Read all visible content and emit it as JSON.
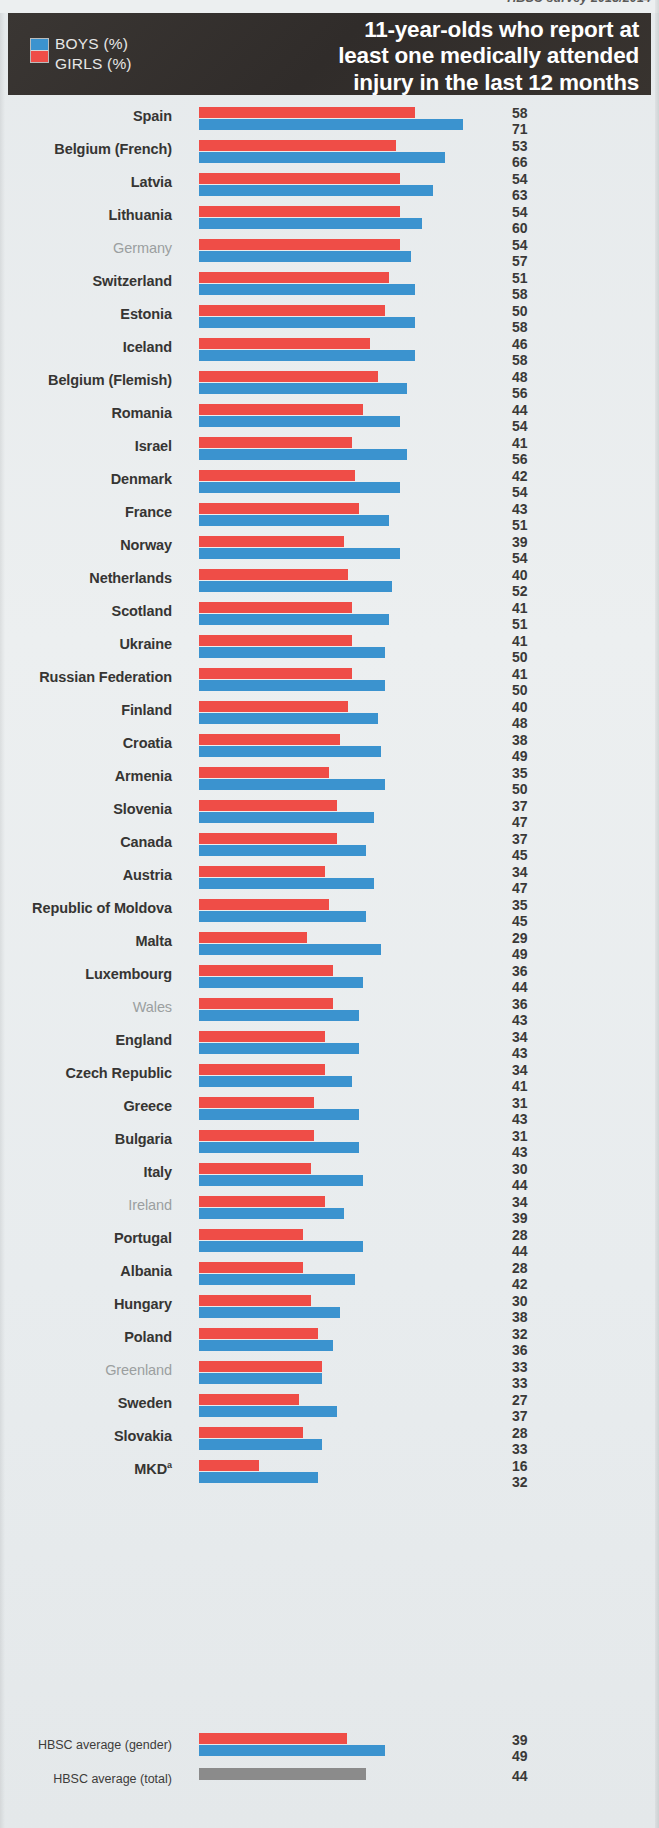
{
  "source_note": "HBSC survey 2013/2014",
  "header": {
    "title_line1": "11-year-olds who report at",
    "title_line2": "least one medically attended",
    "title_line3": "injury in the last 12 months",
    "legend": {
      "boys_label": "BOYS (%)",
      "girls_label": "GIRLS (%)"
    }
  },
  "colors": {
    "boys": "#3b93cf",
    "girls": "#ef4d47",
    "total": "#8b8b8b",
    "banner": "#332f2d",
    "background": "#e9edee",
    "label_bold": "#363533",
    "label_dim": "#9b9fa0"
  },
  "averages": {
    "gender_label": "HBSC average (gender)",
    "total_label": "HBSC average (total)",
    "gender_girls": 39,
    "gender_boys": 49,
    "total_value": 44
  },
  "chart_data": {
    "type": "bar",
    "orientation": "horizontal",
    "title": "11-year-olds who report at least one medically attended injury in the last 12 months",
    "xlabel": "",
    "ylabel": "",
    "xlim": [
      0,
      71
    ],
    "grid": false,
    "legend_position": "top-left",
    "series": [
      {
        "name": "GIRLS (%)",
        "color": "#ef4d47",
        "values": [
          58,
          53,
          54,
          54,
          54,
          51,
          50,
          46,
          48,
          44,
          41,
          42,
          43,
          39,
          40,
          41,
          41,
          41,
          40,
          38,
          35,
          37,
          37,
          34,
          35,
          29,
          36,
          36,
          34,
          34,
          31,
          31,
          30,
          34,
          28,
          28,
          30,
          32,
          33,
          27,
          28,
          16
        ]
      },
      {
        "name": "BOYS (%)",
        "color": "#3b93cf",
        "values": [
          71,
          66,
          63,
          60,
          57,
          58,
          58,
          58,
          56,
          54,
          56,
          54,
          51,
          54,
          52,
          51,
          50,
          50,
          48,
          49,
          50,
          47,
          45,
          47,
          45,
          49,
          44,
          43,
          43,
          41,
          43,
          43,
          44,
          39,
          44,
          42,
          38,
          36,
          33,
          37,
          33,
          32
        ]
      }
    ],
    "categories": [
      "Spain",
      "Belgium (French)",
      "Latvia",
      "Lithuania",
      "Germany",
      "Switzerland",
      "Estonia",
      "Iceland",
      "Belgium (Flemish)",
      "Romania",
      "Israel",
      "Denmark",
      "France",
      "Norway",
      "Netherlands",
      "Scotland",
      "Ukraine",
      "Russian Federation",
      "Finland",
      "Croatia",
      "Armenia",
      "Slovenia",
      "Canada",
      "Austria",
      "Republic of Moldova",
      "Malta",
      "Luxembourg",
      "Wales",
      "England",
      "Czech Republic",
      "Greece",
      "Bulgaria",
      "Italy",
      "Ireland",
      "Portugal",
      "Albania",
      "Hungary",
      "Poland",
      "Greenland",
      "Sweden",
      "Slovakia",
      "MKD"
    ],
    "dimmed_categories": [
      "Germany",
      "Wales",
      "Ireland",
      "Greenland"
    ],
    "footnote_markers": {
      "MKD": "a"
    },
    "averages": {
      "girls": 39,
      "boys": 49,
      "total": 44
    }
  },
  "rows": [
    {
      "label": "Spain",
      "girls": 58,
      "boys": 71,
      "dim": false
    },
    {
      "label": "Belgium (French)",
      "girls": 53,
      "boys": 66,
      "dim": false
    },
    {
      "label": "Latvia",
      "girls": 54,
      "boys": 63,
      "dim": false
    },
    {
      "label": "Lithuania",
      "girls": 54,
      "boys": 60,
      "dim": false
    },
    {
      "label": "Germany",
      "girls": 54,
      "boys": 57,
      "dim": true
    },
    {
      "label": "Switzerland",
      "girls": 51,
      "boys": 58,
      "dim": false
    },
    {
      "label": "Estonia",
      "girls": 50,
      "boys": 58,
      "dim": false
    },
    {
      "label": "Iceland",
      "girls": 46,
      "boys": 58,
      "dim": false
    },
    {
      "label": "Belgium (Flemish)",
      "girls": 48,
      "boys": 56,
      "dim": false
    },
    {
      "label": "Romania",
      "girls": 44,
      "boys": 54,
      "dim": false
    },
    {
      "label": "Israel",
      "girls": 41,
      "boys": 56,
      "dim": false
    },
    {
      "label": "Denmark",
      "girls": 42,
      "boys": 54,
      "dim": false
    },
    {
      "label": "France",
      "girls": 43,
      "boys": 51,
      "dim": false
    },
    {
      "label": "Norway",
      "girls": 39,
      "boys": 54,
      "dim": false
    },
    {
      "label": "Netherlands",
      "girls": 40,
      "boys": 52,
      "dim": false
    },
    {
      "label": "Scotland",
      "girls": 41,
      "boys": 51,
      "dim": false
    },
    {
      "label": "Ukraine",
      "girls": 41,
      "boys": 50,
      "dim": false
    },
    {
      "label": "Russian Federation",
      "girls": 41,
      "boys": 50,
      "dim": false
    },
    {
      "label": "Finland",
      "girls": 40,
      "boys": 48,
      "dim": false
    },
    {
      "label": "Croatia",
      "girls": 38,
      "boys": 49,
      "dim": false
    },
    {
      "label": "Armenia",
      "girls": 35,
      "boys": 50,
      "dim": false
    },
    {
      "label": "Slovenia",
      "girls": 37,
      "boys": 47,
      "dim": false
    },
    {
      "label": "Canada",
      "girls": 37,
      "boys": 45,
      "dim": false
    },
    {
      "label": "Austria",
      "girls": 34,
      "boys": 47,
      "dim": false
    },
    {
      "label": "Republic of Moldova",
      "girls": 35,
      "boys": 45,
      "dim": false
    },
    {
      "label": "Malta",
      "girls": 29,
      "boys": 49,
      "dim": false
    },
    {
      "label": "Luxembourg",
      "girls": 36,
      "boys": 44,
      "dim": false
    },
    {
      "label": "Wales",
      "girls": 36,
      "boys": 43,
      "dim": true
    },
    {
      "label": "England",
      "girls": 34,
      "boys": 43,
      "dim": false
    },
    {
      "label": "Czech Republic",
      "girls": 34,
      "boys": 41,
      "dim": false
    },
    {
      "label": "Greece",
      "girls": 31,
      "boys": 43,
      "dim": false
    },
    {
      "label": "Bulgaria",
      "girls": 31,
      "boys": 43,
      "dim": false
    },
    {
      "label": "Italy",
      "girls": 30,
      "boys": 44,
      "dim": false
    },
    {
      "label": "Ireland",
      "girls": 34,
      "boys": 39,
      "dim": true
    },
    {
      "label": "Portugal",
      "girls": 28,
      "boys": 44,
      "dim": false
    },
    {
      "label": "Albania",
      "girls": 28,
      "boys": 42,
      "dim": false
    },
    {
      "label": "Hungary",
      "girls": 30,
      "boys": 38,
      "dim": false
    },
    {
      "label": "Poland",
      "girls": 32,
      "boys": 36,
      "dim": false
    },
    {
      "label": "Greenland",
      "girls": 33,
      "boys": 33,
      "dim": true
    },
    {
      "label": "Sweden",
      "girls": 27,
      "boys": 37,
      "dim": false
    },
    {
      "label": "Slovakia",
      "girls": 28,
      "boys": 33,
      "dim": false
    },
    {
      "label": "MKD",
      "girls": 16,
      "boys": 32,
      "dim": false,
      "sup": "a"
    }
  ]
}
